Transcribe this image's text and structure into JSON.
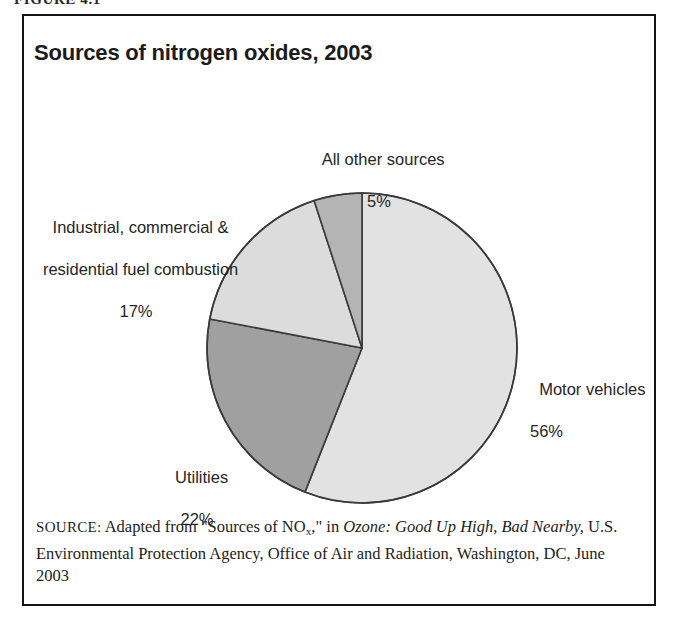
{
  "figure": {
    "number_label": "FIGURE 4.1",
    "title": "Sources of nitrogen oxides, 2003"
  },
  "chart_data": {
    "type": "pie",
    "title": "Sources of nitrogen oxides, 2003",
    "unit": "%",
    "legend_position": "callout-labels",
    "categories": [
      "Motor vehicles",
      "Utilities",
      "Industrial, commercial & residential fuel combustion",
      "All other sources"
    ],
    "values": [
      56,
      22,
      17,
      5
    ],
    "slices": [
      {
        "name": "Motor vehicles",
        "label_line1": "Motor vehicles",
        "label_line2": "56%",
        "value": 56,
        "color": "#e2e2e2"
      },
      {
        "name": "Utilities",
        "label_line1": "Utilities",
        "label_line2": "22%",
        "value": 22,
        "color": "#a0a0a0"
      },
      {
        "name": "Industrial, commercial & residential fuel combustion",
        "label_line1": "Industrial, commercial &",
        "label_line2": "residential fuel combustion",
        "label_line3": "17%",
        "value": 17,
        "color": "#dcdcdc"
      },
      {
        "name": "All other sources",
        "label_line1": "All other sources",
        "label_line2": "5%",
        "value": 5,
        "color": "#b4b4b4"
      }
    ]
  },
  "source": {
    "prefix": "SOURCE:",
    "text_before_title": " Adapted from \"Sources of NO",
    "subscript": "x",
    "text_after_subscript": ",\" in ",
    "italic_title": "Ozone: Good Up High, Bad Nearby,",
    "text_after_title": " U.S. Environmental Protection Agency, Office of Air and Radiation, Washington, DC, June 2003"
  },
  "colors": {
    "motor_vehicles": "#e2e2e2",
    "utilities": "#a0a0a0",
    "industrial": "#dcdcdc",
    "all_other": "#b4b4b4",
    "stroke": "#3a3a3a",
    "border": "#141414"
  }
}
